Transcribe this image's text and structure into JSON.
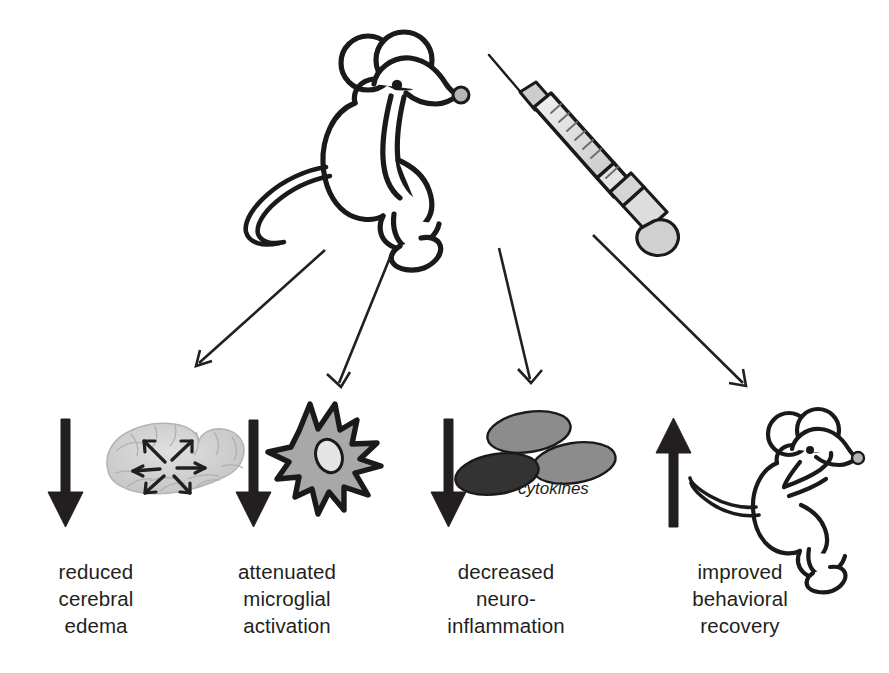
{
  "figure": {
    "background_color": "#ffffff",
    "width": 889,
    "height": 673
  },
  "source": {
    "mouse_icon": "mouse-icon",
    "syringe_icon": "syringe-icon",
    "description": "treated mouse with syringe"
  },
  "connectors": [
    {
      "name": "connector-arrow-1",
      "from": [
        325,
        250
      ],
      "to": [
        196,
        366
      ]
    },
    {
      "name": "connector-arrow-2",
      "from": [
        393,
        250
      ],
      "to": [
        341,
        387
      ]
    },
    {
      "name": "connector-arrow-3",
      "from": [
        499,
        248
      ],
      "to": [
        531,
        383
      ]
    },
    {
      "name": "connector-arrow-4",
      "from": [
        593,
        235
      ],
      "to": [
        746,
        386
      ]
    }
  ],
  "outcomes": [
    {
      "id": "reduced-cerebral-edema",
      "direction": "down",
      "direction_symbol": "↓",
      "icon": "brain-icon",
      "icon_label": "brain with radiating swelling arrows",
      "caption": "reduced\ncerebral\nedema",
      "caption_lines": [
        "reduced",
        "cerebral",
        "edema"
      ]
    },
    {
      "id": "attenuated-microglial-activation",
      "direction": "down",
      "direction_symbol": "↓",
      "icon": "microglia-cell-icon",
      "icon_label": "activated star-shaped microglial cell",
      "caption": "attenuated\nmicroglial\nactivation",
      "caption_lines": [
        "attenuated",
        "microglial",
        "activation"
      ]
    },
    {
      "id": "decreased-neuroinflammation",
      "direction": "down",
      "direction_symbol": "↓",
      "icon": "cytokines-icon",
      "icon_label": "three cytokine particles",
      "icon_annotation": "cytokines",
      "caption": "decreased\nneuro-\ninflammation",
      "caption_lines": [
        "decreased",
        "neuro-",
        "inflammation"
      ]
    },
    {
      "id": "improved-behavioral-recovery",
      "direction": "up",
      "direction_symbol": "↑",
      "icon": "mouse-icon",
      "icon_label": "recovered mouse",
      "caption": "improved\nbehavioral\nrecovery",
      "caption_lines": [
        "improved",
        "behavioral",
        "recovery"
      ]
    }
  ],
  "colors": {
    "ink": "#231f20",
    "outline": "#1a1a1a",
    "arrow_black": "#231f20",
    "brain_grey": "#cfcfcf",
    "microglia_grey": "#a8a8a8",
    "nucleus_grey": "#e2e2e2",
    "cytokine_grey": "#8c8c8c",
    "cytokine_dark": "#333333",
    "syringe_grey": "#d5d5d5",
    "syringe_barrel": "#e8e8e8",
    "background": "#ffffff"
  }
}
